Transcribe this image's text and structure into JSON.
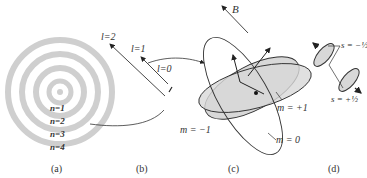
{
  "panel_a": {
    "caption": "(a)",
    "labels": [
      "n=1",
      "n=2",
      "n=3",
      "n=4"
    ]
  },
  "panel_b": {
    "caption": "(b)",
    "labels": [
      "l=2",
      "l=1",
      "l=0"
    ]
  },
  "panel_c": {
    "caption": "(c)",
    "field_label": "B",
    "labels": [
      "m = +1",
      "m = −1",
      "m = 0"
    ]
  },
  "panel_d": {
    "caption": "(d)",
    "labels": [
      "s = −½",
      "s = +½"
    ]
  },
  "colors": {
    "ring": "#cfcfcf",
    "line": "#333333",
    "fill": "#d8d8d8"
  }
}
